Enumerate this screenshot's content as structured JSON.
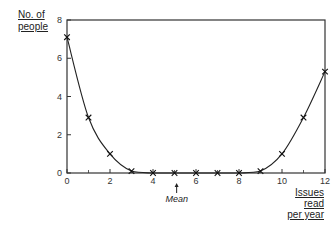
{
  "chart_data": {
    "type": "line",
    "title": "",
    "xlabel_lines": [
      "Issues",
      "read",
      "per year"
    ],
    "ylabel_lines": [
      "No. of",
      "people"
    ],
    "xlim": [
      0,
      12
    ],
    "ylim": [
      0,
      8
    ],
    "x_ticks": [
      0,
      2,
      4,
      6,
      8,
      10,
      12
    ],
    "y_ticks": [
      0,
      2,
      4,
      6,
      8
    ],
    "grid": false,
    "legend": "none",
    "series": [
      {
        "name": "Number of people",
        "marker": "x",
        "x": [
          0,
          1,
          2,
          3,
          4,
          5,
          6,
          7,
          8,
          9,
          10,
          11,
          12
        ],
        "y": [
          7.1,
          2.9,
          1.0,
          0.1,
          0,
          0,
          0,
          0,
          0,
          0.1,
          1.0,
          2.9,
          5.3
        ]
      }
    ],
    "annotations": [
      {
        "text": "Mean",
        "x": 5.1,
        "type": "arrow-up-below-axis"
      }
    ]
  }
}
